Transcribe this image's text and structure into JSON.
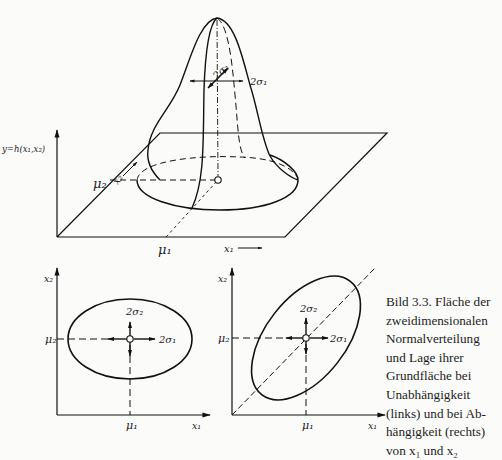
{
  "figure": {
    "top": {
      "y_axis_label": "y=h(x₁,x₂)",
      "x1_label": "x₁",
      "x2_label": "x₂",
      "mu1_label": "μ₁",
      "mu2_label": "μ₂",
      "sigma1_label": "2σ₁",
      "sigma2_label": "2σ₂"
    },
    "bottom_left": {
      "x1_label": "x₁",
      "x2_label": "x₂",
      "mu1_label": "μ₁",
      "mu2_label": "μ₂",
      "sigma1_label": "2σ₁",
      "sigma2_label": "2σ₂"
    },
    "bottom_right": {
      "x1_label": "x₁",
      "x2_label": "x₂",
      "mu1_label": "μ₁",
      "mu2_label": "μ₂",
      "sigma1_label": "2σ₁",
      "sigma2_label": "2σ₂"
    }
  },
  "caption": {
    "lines": [
      "Bild 3.3. Fläche der",
      "zweidimensionalen",
      "Normalverteilung",
      "und Lage ihrer",
      "Grundfläche bei",
      "Unabhängigkeit",
      "(links) und bei Ab-",
      "hängigkeit (rechts)",
      "von x₁ und x₂"
    ]
  }
}
